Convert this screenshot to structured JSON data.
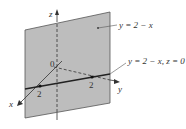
{
  "figure": {
    "plane_label": "y = 2 − x",
    "trace_label": "y = 2 − x, z = 0",
    "axes": {
      "x": "x",
      "y": "y",
      "z": "z"
    },
    "origin_label": "0",
    "x_intercept_label": "2",
    "y_intercept_label": "2"
  },
  "colors": {
    "plane_fill": "#bdbdbd",
    "plane_edge": "#555555",
    "axis": "#333333",
    "trace": "#222222"
  }
}
